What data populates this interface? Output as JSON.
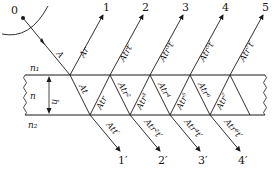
{
  "diagram": {
    "source_label": "0",
    "incident_label": "A",
    "media": {
      "top": "n₁",
      "film": "n",
      "bottom": "n₂"
    },
    "thickness_label": "h",
    "reflected": [
      {
        "number": "1",
        "amplitude": "Ar"
      },
      {
        "number": "2",
        "amplitude": "Atrt′"
      },
      {
        "number": "3",
        "amplitude": "Atr³t′"
      },
      {
        "number": "4",
        "amplitude": "Atr⁵t′"
      },
      {
        "number": "5",
        "amplitude": "Atr⁷t′"
      }
    ],
    "transmitted": [
      {
        "number": "1′",
        "amplitude": "Att′"
      },
      {
        "number": "2′",
        "amplitude": "Atr²t′"
      },
      {
        "number": "3′",
        "amplitude": "Atr⁴t′"
      },
      {
        "number": "4′",
        "amplitude": "Atr⁶t′"
      }
    ],
    "internal_down": [
      "At",
      "Atr²",
      "Atr⁴",
      "Atr⁶"
    ],
    "internal_up": [
      "Atr",
      "Atr³",
      "Atr⁵",
      "Atr⁷"
    ],
    "colors": {
      "line": "#1a1a1a",
      "background": "#ffffff"
    }
  }
}
